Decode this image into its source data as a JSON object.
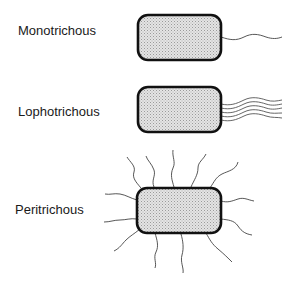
{
  "diagram": {
    "type": "bacterial flagella arrangements",
    "items": [
      {
        "label": "Monotrichous",
        "flagella_count": 1,
        "arrangement": "single polar flagellum"
      },
      {
        "label": "Lophotrichous",
        "flagella_count": 5,
        "arrangement": "tuft of polar flagella"
      },
      {
        "label": "Peritrichous",
        "flagella_count": 14,
        "arrangement": "flagella all around the cell"
      }
    ],
    "colors": {
      "cell_fill": "#d9d9d9",
      "cell_outline": "#111111",
      "flagellum": "#444444"
    }
  }
}
